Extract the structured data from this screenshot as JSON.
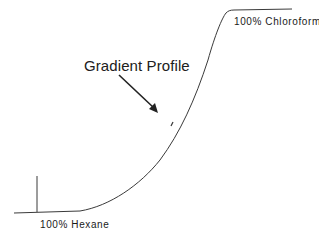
{
  "diagram": {
    "title": "Gradient Profile",
    "start_label": "100% Hexane",
    "end_label": "100% Chloroform",
    "colors": {
      "line": "#3a3a3a",
      "arrow": "#222222",
      "background": "#ffffff"
    }
  }
}
